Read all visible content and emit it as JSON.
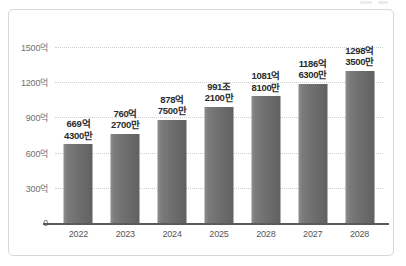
{
  "chart_data": {
    "type": "bar",
    "title": "",
    "subtitle": "",
    "xlabel": "",
    "ylabel": "",
    "categories": [
      "2022",
      "2023",
      "2024",
      "2025",
      "2028",
      "2027",
      "2028"
    ],
    "values": [
      669.43,
      760.27,
      878.75,
      991.21,
      1081.81,
      1186.63,
      1298.35
    ],
    "value_unit": "억",
    "data_labels": [
      {
        "line1": "669억",
        "line2": "4300만"
      },
      {
        "line1": "760억",
        "line2": "2700만"
      },
      {
        "line1": "878억",
        "line2": "7500만"
      },
      {
        "line1": "991조",
        "line2": "2100만"
      },
      {
        "line1": "1081억",
        "line2": "8100만"
      },
      {
        "line1": "1186억",
        "line2": "6300만"
      },
      {
        "line1": "1298억",
        "line2": "3500만"
      }
    ],
    "ylim": [
      0,
      1500
    ],
    "yticks": [
      0,
      300,
      600,
      900,
      1200,
      1500
    ],
    "ytick_labels": [
      "0",
      "300억",
      "600억",
      "900억",
      "1200억",
      "1500억"
    ],
    "grid": true,
    "grid_axis": "y",
    "grid_style": "dotted",
    "legend": false,
    "legend_position": "none",
    "colors": {
      "bar_light": "#8d8d8d",
      "bar_dark": "#606060",
      "gridline": "#cfcfcf",
      "axis_line": "#5a5a5a",
      "tick_text": "#6f6f6f",
      "label_text": "#2b2b2b",
      "card_border": "#d9d9d9",
      "background": "#ffffff"
    }
  }
}
